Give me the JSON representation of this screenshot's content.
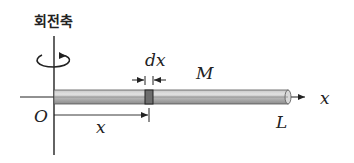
{
  "diagram": {
    "axis_label": "회전축",
    "element_label": "dx",
    "mass_label": "M",
    "x_axis_label": "x",
    "origin_label": "O",
    "position_label": "x",
    "length_label": "L"
  },
  "colors": {
    "line": "#222222",
    "rod_light": "#d6d6d6",
    "rod_mid": "#b4b4b4",
    "rod_dark": "#8a8a8a",
    "element": "#6e6e6e"
  }
}
